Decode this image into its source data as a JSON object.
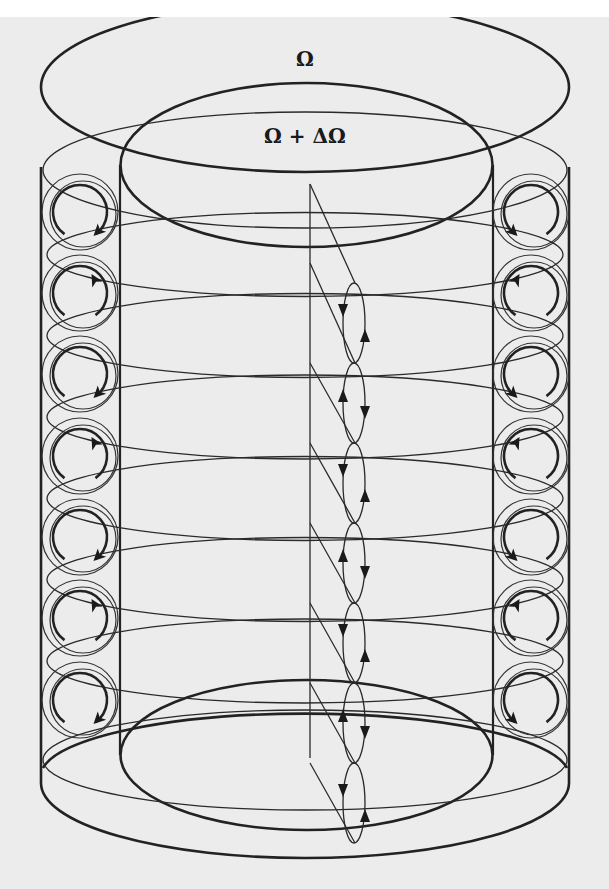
{
  "figure": {
    "labels": {
      "outer_rotation": "Ω",
      "inner_rotation": "Ω + ΔΩ"
    },
    "colors": {
      "background": "#ececec",
      "page": "#ffffff",
      "ink": "#222222"
    },
    "geometry": {
      "outer_cylinder": {
        "left_x": 41,
        "right_x": 569,
        "top_center_y": 87,
        "bottom_center_y": 798,
        "rx": 264,
        "ry": 45
      },
      "inner_cylinder": {
        "left_x": 120,
        "right_x": 493,
        "top_center_y": 165,
        "bottom_center_y": 735,
        "rx": 186,
        "ry": 64
      },
      "vortex_cells_per_side": 7,
      "left_cell_x": 80,
      "right_cell_x": 531,
      "cell_centers_y": [
        212,
        293,
        374,
        456,
        537,
        618,
        700
      ],
      "cell_directions_left": [
        "cw",
        "ccw",
        "cw",
        "ccw",
        "cw",
        "ccw",
        "cw"
      ],
      "cell_directions_right": [
        "ccw",
        "cw",
        "ccw",
        "cw",
        "ccw",
        "cw",
        "ccw"
      ],
      "meridional_plane": {
        "axis_x": 310,
        "apex_y": 184
      },
      "small_vortices_x": 354,
      "small_vortex_centers_y": [
        323,
        403,
        483,
        563,
        643,
        723,
        803
      ],
      "small_vortex_directions": [
        "down-left/up-right",
        "up-left/down-right",
        "down-left/up-right",
        "up-left/down-right",
        "down-left/up-right",
        "up-left/down-right",
        "down-left/up-right"
      ]
    }
  }
}
